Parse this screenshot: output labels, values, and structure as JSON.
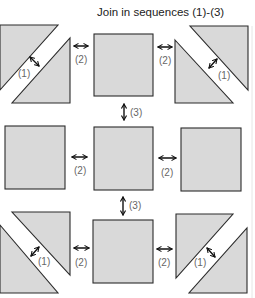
{
  "title": "Join in sequences (1)-(3)",
  "colors": {
    "piece_fill": "#d9d9d9",
    "outline": "#2b2b2b",
    "arrow": "#111111",
    "label_text": "#666666",
    "background": "#ffffff"
  },
  "step_labels": {
    "step1": "(1)",
    "step2": "(2)",
    "step3": "(3)"
  },
  "grid": {
    "rows": [
      {
        "name": "top",
        "units": [
          "half-square-triangle unit",
          "plain square",
          "half-square-triangle unit"
        ]
      },
      {
        "name": "middle",
        "units": [
          "plain square",
          "plain square",
          "plain square"
        ]
      },
      {
        "name": "bottom",
        "units": [
          "half-square-triangle unit",
          "plain square",
          "half-square-triangle unit"
        ]
      }
    ],
    "sequence": [
      "(1) join triangle pairs into squares",
      "(2) join squares into rows",
      "(3) join rows together"
    ]
  },
  "icons": {
    "double_arrow": "double-headed-arrow"
  }
}
